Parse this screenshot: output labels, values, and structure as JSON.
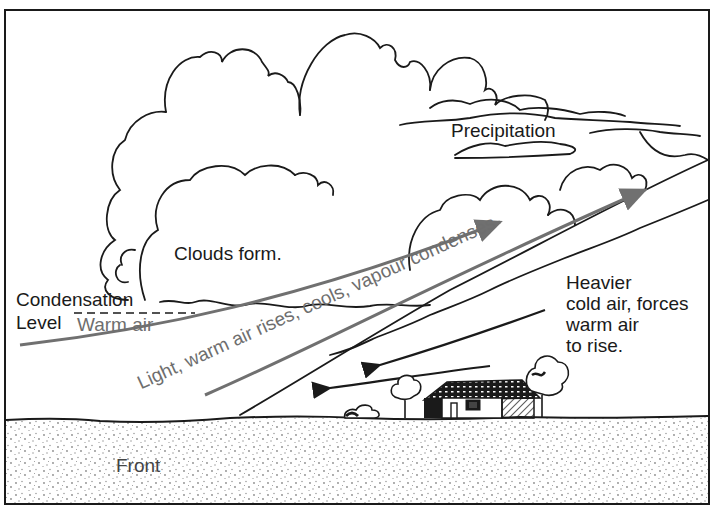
{
  "diagram": {
    "type": "weather-front-cross-section",
    "labels": {
      "precipitation": "Precipitation",
      "clouds_form": "Clouds form.",
      "condensation_level_line1": "Condensation",
      "condensation_level_line2": "Level",
      "warm_air": "Warm air",
      "rising_air": "Light, warm air rises, cools, vapour condenses",
      "cold_air_line1": "Heavier",
      "cold_air_line2": "cold air, forces",
      "cold_air_line3": "warm air",
      "cold_air_line4": "to rise.",
      "front": "Front"
    },
    "colors": {
      "ink": "#1a1a1a",
      "warm_air_arrow": "#707070",
      "ground_stipple": "#8a8a8a",
      "background": "#ffffff"
    }
  }
}
